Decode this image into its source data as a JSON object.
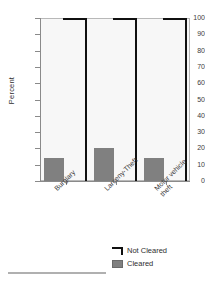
{
  "chart_data": {
    "type": "bar",
    "title": "",
    "subtitle": "",
    "xlabel": "",
    "ylabel": "Percent",
    "ylim": [
      0,
      100
    ],
    "ytick_labels": [
      "100",
      "90",
      "80",
      "70",
      "60",
      "50",
      "40",
      "30",
      "20",
      "10",
      "0"
    ],
    "ytick_values": [
      100,
      90,
      80,
      70,
      60,
      50,
      40,
      30,
      20,
      10,
      0
    ],
    "grid": false,
    "legend_position": "bottom-right",
    "categories": [
      "Burglary",
      "Larceny-Theft",
      "Motor vehicle theft"
    ],
    "category_lines": [
      [
        "Burglary"
      ],
      [
        "Larceny-Theft"
      ],
      [
        "Motor vehicle",
        "theft"
      ]
    ],
    "series": [
      {
        "name": "Not Cleared",
        "values": [
          100,
          100,
          100
        ],
        "style": "outline",
        "color": "#101010"
      },
      {
        "name": "Cleared",
        "values": [
          14,
          20,
          14
        ],
        "style": "filled",
        "color": "#808080"
      }
    ]
  },
  "legend": {
    "items": [
      {
        "label": "Not Cleared",
        "swatch": "outline-box-icon"
      },
      {
        "label": "Cleared",
        "swatch": "filled-box-icon"
      }
    ]
  },
  "colors": {
    "plot_background": "#f7f7f7",
    "plot_border": "#b8b8b8",
    "axis": "#8a8a8a",
    "bar_cleared": "#808080",
    "bar_not_cleared": "#101010",
    "text": "#2e2e2e",
    "footer_rule": "#b0b0b0"
  }
}
